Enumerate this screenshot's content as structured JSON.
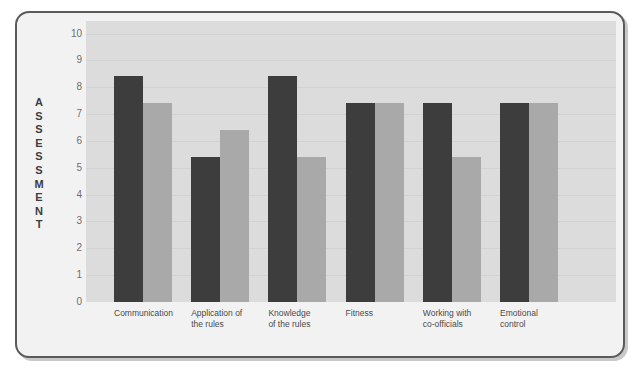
{
  "chart_data": {
    "type": "bar",
    "title": "",
    "xlabel": "",
    "ylabel": "ASSESSMENT",
    "ylim": [
      0,
      10
    ],
    "yticks": [
      10,
      9,
      8,
      7,
      6,
      5,
      4,
      3,
      2,
      1,
      0
    ],
    "grid": true,
    "legend": "none",
    "categories": [
      "Communication",
      "Application of\nthe rules",
      "Knowledge\nof the rules",
      "Fitness",
      "Working with\nco-officials",
      "Emotional\ncontrol"
    ],
    "series": [
      {
        "name": "Series 1",
        "color": "#3d3d3d",
        "values": [
          8.4,
          5.4,
          8.4,
          7.4,
          7.4,
          7.4
        ]
      },
      {
        "name": "Series 2",
        "color": "#a9a9a9",
        "values": [
          7.4,
          6.4,
          5.4,
          7.4,
          5.4,
          7.4
        ]
      }
    ]
  },
  "axis": {
    "vertical_title_letters": [
      "A",
      "S",
      "S",
      "E",
      "S",
      "S",
      "M",
      "E",
      "N",
      "T"
    ]
  },
  "colors": {
    "plot_background": "#dcdcdc",
    "frame_background": "#f2f2f2",
    "frame_border": "#5a5a5a",
    "series_dark": "#3d3d3d",
    "series_light": "#a9a9a9",
    "tick_text": "#6f6f6f",
    "label_text": "#4a4a4a"
  }
}
